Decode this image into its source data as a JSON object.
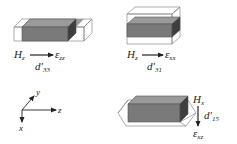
{
  "colors": {
    "front_face": "#7a7a7a",
    "top_face": "#9a9a9a",
    "side_face": "#3e3e3e",
    "outline": "#555555",
    "ghost_outline": "#8a8a8a",
    "text": "#222222"
  },
  "panels": [
    {
      "id": "d33",
      "field": {
        "base": "H",
        "sub": "z"
      },
      "strain": {
        "base": "ε",
        "sub": "zz"
      },
      "coefficient": {
        "base": "d′",
        "sub": "33"
      },
      "arrow_direction": "right",
      "deformation": "elongation along z"
    },
    {
      "id": "d31",
      "field": {
        "base": "H",
        "sub": "z"
      },
      "strain": {
        "base": "ε",
        "sub": "xx"
      },
      "coefficient": {
        "base": "d′",
        "sub": "31"
      },
      "arrow_direction": "right",
      "deformation": "expansion along x"
    },
    {
      "id": "d15",
      "field": {
        "base": "H",
        "sub": "x"
      },
      "strain": {
        "base": "ε",
        "sub": "xz"
      },
      "coefficient": {
        "base": "d′",
        "sub": "15"
      },
      "arrow_direction": "down",
      "deformation": "shear in x-z plane"
    }
  ],
  "axes": {
    "labels": {
      "x": "x",
      "y": "y",
      "z": "z"
    }
  }
}
